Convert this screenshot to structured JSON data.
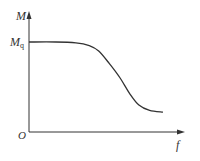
{
  "chart_data": {
    "type": "line",
    "title": "",
    "xlabel": "f",
    "ylabel": "M",
    "origin_label": "O",
    "y_tick_labels": [
      {
        "main": "M",
        "sub": "q",
        "position": "max plateau"
      }
    ],
    "grid": false,
    "legend": null,
    "series": [
      {
        "name": "M(f)",
        "x": [
          0,
          0.2,
          0.35,
          0.45,
          0.52,
          0.6,
          0.68,
          0.75,
          0.82,
          0.9,
          1.0
        ],
        "y": [
          1.0,
          1.0,
          0.99,
          0.96,
          0.9,
          0.76,
          0.6,
          0.43,
          0.3,
          0.24,
          0.22
        ]
      }
    ],
    "xlim": [
      0,
      1.15
    ],
    "ylim": [
      0,
      1.25
    ],
    "colors": {
      "axis": "#333333",
      "curve": "#333333"
    }
  },
  "labels": {
    "y_axis": "M",
    "x_axis": "f",
    "origin": "O",
    "mq_main": "M",
    "mq_sub": "q"
  }
}
